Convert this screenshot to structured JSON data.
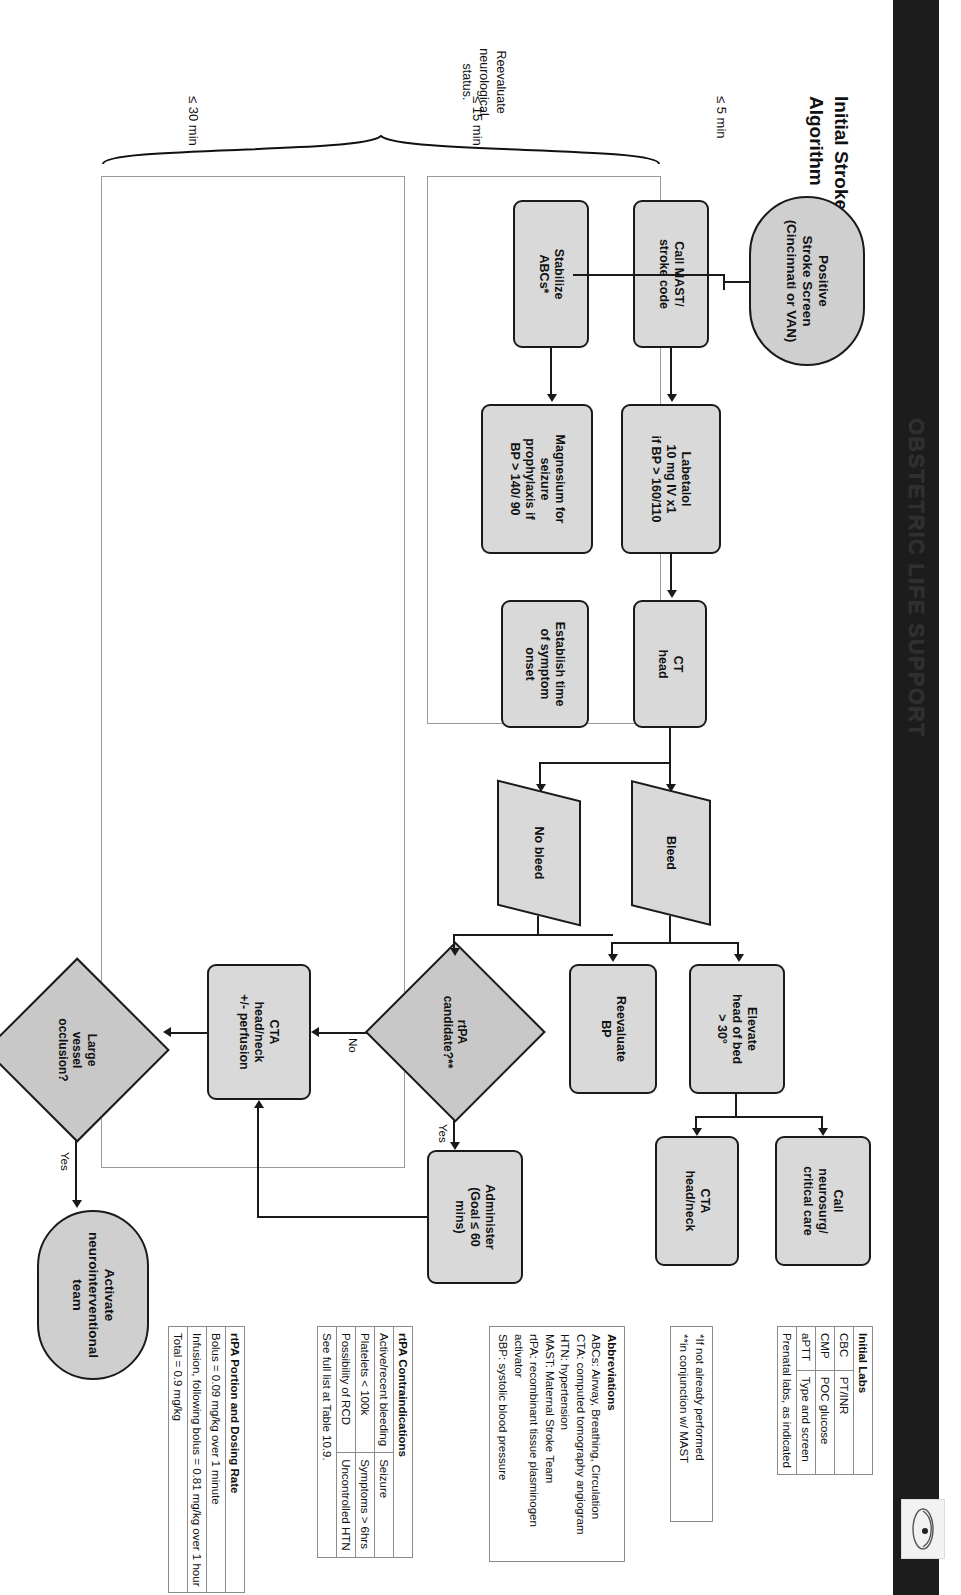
{
  "header": {
    "brand": "OBSTETRIC LIFE SUPPORT",
    "logo_icon": "obstetric-logo-icon"
  },
  "page_title": "Initial Stroke Management\nAlgorithm",
  "timings": {
    "t5": "≤ 5 min",
    "t15": "≤ 15 min",
    "t30": "≤ 30 min"
  },
  "reevaluate_note": "Reevaluate\nneurological\nstatus.",
  "flow": {
    "start": "Positive\nStroke Screen\n(Cincinnati or VAN)",
    "call_mast": "Call MAST/\nstroke code",
    "stabilize": "Stabilize\nABCs*",
    "labetalol": "Labetalol\n10 mg IV x1\nif BP > 160/110",
    "magnesium": "Magnesium for\nseizure\nprophylaxis if\nBP > 140/ 90",
    "ct_head": "CT\nhead",
    "establish_time": "Establish time\nof symptom\nonset",
    "bleed": "Bleed",
    "no_bleed": "No bleed",
    "elevate": "Elevate\nhead of bed\n> 30°",
    "reevaluate_bp": "Reevaluate\nBP",
    "call_neurosurg": "Call\nneurosurg/\ncritical care",
    "cta_head_neck": "CTA\nhead/neck",
    "rtpa_candidate": "rtPA\ncandidate?**",
    "administer": "Administer\n(Goal ≤ 60\nmins)",
    "cta_perfusion": "CTA\nhead/neck\n+/- perfusion",
    "lvo": "Large\nvessel\nocclusion?",
    "activate_neuro": "Activate\nneurointerventional\nteam"
  },
  "edge_labels": {
    "yes1": "Yes",
    "no1": "No",
    "yes2": "Yes"
  },
  "initial_labs": {
    "header": "Initial Labs",
    "rows": [
      [
        "CBC",
        "PT/INR"
      ],
      [
        "CMP",
        "POC glucose"
      ],
      [
        "aPTT",
        "Type and screen"
      ],
      [
        "Prenatal labs, as indicated",
        ""
      ]
    ]
  },
  "footnotes": {
    "line1": "*If not already performed",
    "line2": "**in conjunction w/ MAST"
  },
  "abbreviations": {
    "header": "Abbreviations",
    "items": [
      "ABCs: Airway, Breathing, Circulation",
      "CTA: computed tomography angiogram",
      "HTN: hypertension",
      "MAST: Maternal Stroke Team",
      "rtPA: recombinant tissue plasminogen activator",
      "SBP: systolic blood pressure"
    ]
  },
  "contraindications": {
    "header": "rtPA Contraindications",
    "rows": [
      [
        "Active/recent bleeding",
        "Seizure"
      ],
      [
        "Platelets < 100k",
        "Symptoms > 6hrs"
      ],
      [
        "Possibility of RCD",
        "Uncontrolled HTN"
      ],
      [
        "See full list at Table 10.9.",
        ""
      ]
    ]
  },
  "dosing": {
    "header": "rtPA Portion and Dosing Rate",
    "rows": [
      "Bolus = 0.09 mg/kg over 1 minute",
      "Infusion, following bolus = 0.81 mg/kg over 1 hour",
      "Total = 0.9 mg/kg"
    ]
  }
}
